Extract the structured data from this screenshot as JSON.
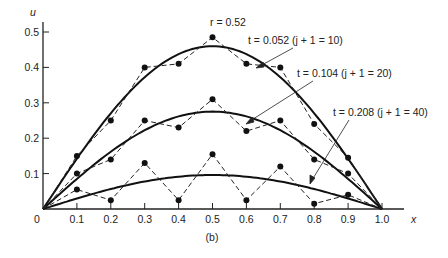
{
  "chart_data": {
    "type": "line",
    "title": "",
    "subtitle": "(b)",
    "xlabel": "x",
    "ylabel": "u",
    "xlim": [
      0,
      1.0
    ],
    "ylim": [
      0,
      0.5
    ],
    "grid": false,
    "x_ticks": [
      "0",
      "0.1",
      "0.2",
      "0.3",
      "0.4",
      "0.5",
      "0.6",
      "0.7",
      "0.8",
      "0.9",
      "1.0"
    ],
    "y_ticks": [
      "0.1",
      "0.2",
      "0.3",
      "0.4",
      "0.5"
    ],
    "annotations": {
      "r": "r = 0.52",
      "t1": "t = 0.052 (j + 1 = 10)",
      "t2": "t = 0.104 (j + 1 = 20)",
      "t3": "t = 0.208 (j + 1 = 40)"
    },
    "x": [
      0,
      0.1,
      0.2,
      0.3,
      0.4,
      0.5,
      0.6,
      0.7,
      0.8,
      0.9,
      1.0
    ],
    "series": [
      {
        "name": "numerical t = 0.052 (j+1=10)",
        "style": "dashed-with-dots",
        "values": [
          0,
          0.15,
          0.25,
          0.4,
          0.41,
          0.485,
          0.41,
          0.4,
          0.24,
          0.145,
          0
        ]
      },
      {
        "name": "numerical t = 0.104 (j+1=20)",
        "style": "dashed-with-dots",
        "values": [
          0,
          0.1,
          0.14,
          0.25,
          0.23,
          0.31,
          0.22,
          0.25,
          0.14,
          0.1,
          0
        ]
      },
      {
        "name": "numerical t = 0.208 (j+1=40)",
        "style": "dashed-with-dots",
        "values": [
          0,
          0.055,
          0.025,
          0.13,
          0.025,
          0.155,
          0.025,
          0.12,
          0.015,
          0.04,
          0
        ]
      },
      {
        "name": "exact t = 0.052",
        "style": "solid",
        "peak": 0.46
      },
      {
        "name": "exact t = 0.104",
        "style": "solid",
        "peak": 0.275
      },
      {
        "name": "exact t = 0.208",
        "style": "solid",
        "peak": 0.096
      }
    ]
  }
}
